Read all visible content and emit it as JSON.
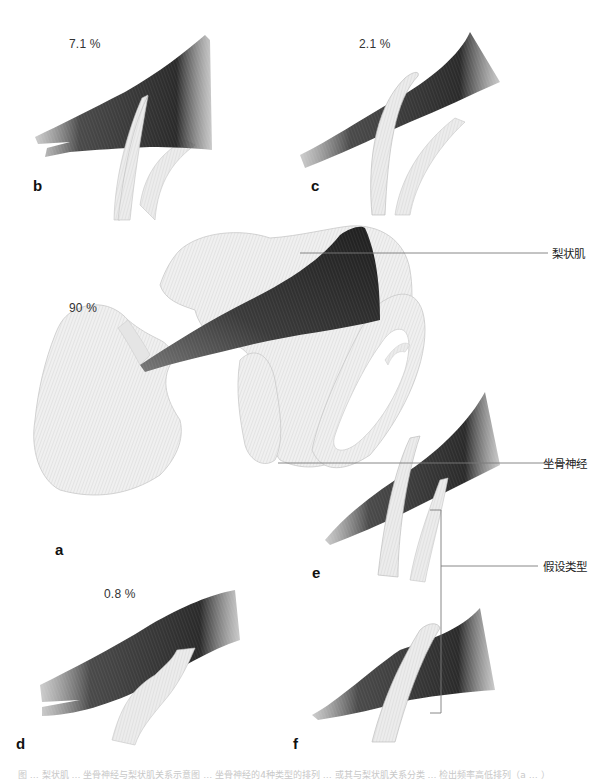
{
  "figure": {
    "panels": [
      {
        "id": "a",
        "letter": "a",
        "percentage": "90 %",
        "description": "Pelvis and femur with piriformis muscle; sciatic nerve passes below the muscle"
      },
      {
        "id": "b",
        "letter": "b",
        "percentage": "7.1 %",
        "description": "Nerve divides; one branch pierces the muscle, other passes below"
      },
      {
        "id": "c",
        "letter": "c",
        "percentage": "2.1 %",
        "description": "One branch passes above, other below the muscle"
      },
      {
        "id": "d",
        "letter": "d",
        "percentage": "0.8 %",
        "description": "Undivided nerve passes through the muscle"
      },
      {
        "id": "e",
        "letter": "e",
        "percentage": "",
        "description": "Hypothetical type: branches above and through"
      },
      {
        "id": "f",
        "letter": "f",
        "percentage": "",
        "description": "Hypothetical type: undivided nerve above muscle"
      }
    ],
    "labels": {
      "piriformis": "梨状肌",
      "sciatic_nerve": "坐骨神经",
      "hypothetical_types": "假设类型"
    },
    "caption": "图 … 梨状肌 … 坐骨神经与梨状肌关系示意图 … 坐骨神经的4种类型的排列 … 或其与梨状肌关系分类 … 检出频率高低排列（a … ）",
    "colors": {
      "muscle_dark": "#2e2e2e",
      "muscle_mid": "#6a6a6a",
      "bone": "#eeeeee",
      "bone_edge": "#bdbdbd",
      "nerve": "#e6e6e6",
      "leader_line": "#777777",
      "text": "#222222"
    }
  }
}
